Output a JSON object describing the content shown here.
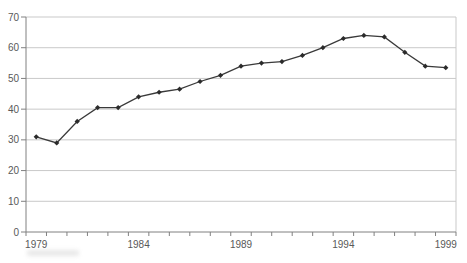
{
  "page": {
    "background": "#ffffff"
  },
  "chart_data": {
    "type": "line",
    "title": "",
    "xlabel": "",
    "ylabel": "",
    "categories": [
      1979,
      1980,
      1981,
      1982,
      1983,
      1984,
      1985,
      1986,
      1987,
      1988,
      1989,
      1990,
      1991,
      1992,
      1993,
      1994,
      1995,
      1996,
      1997,
      1998,
      1999
    ],
    "series": [
      {
        "name": "series-1",
        "values": [
          31,
          29,
          36,
          40.5,
          40.5,
          44,
          45.5,
          46.5,
          49,
          51,
          54,
          55,
          55.5,
          57.5,
          60,
          63,
          64,
          63.5,
          58.5,
          54,
          53.5
        ]
      }
    ],
    "ylim": [
      0,
      70
    ],
    "ytick_step": 10,
    "labeled_x_ticks": [
      1979,
      1984,
      1989,
      1994,
      1999
    ],
    "grid": true,
    "legend": null,
    "marker": "diamond",
    "colors": {
      "line": "#3a3a3a",
      "marker": "#2b2b2b",
      "grid": "#c9c9c9",
      "plot_border": "#c9c9c9",
      "axis": "#808080",
      "tick_label": "#595959",
      "background": "#ffffff"
    }
  }
}
